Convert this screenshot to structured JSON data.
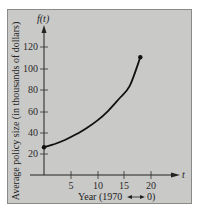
{
  "chart_data": {
    "type": "line",
    "title": "",
    "xlabel": "Year (1970 → 0)",
    "ylabel": "Average policy size (in thousands of dollars)",
    "x_axis_name": "t",
    "y_axis_name": "f(t)",
    "xlim": [
      0,
      22
    ],
    "ylim": [
      0,
      130
    ],
    "x_ticks": [
      5,
      10,
      15,
      20
    ],
    "y_ticks": [
      20,
      40,
      60,
      80,
      100,
      120
    ],
    "grid": false,
    "legend": null,
    "series": [
      {
        "name": "f(t)",
        "x": [
          0,
          2,
          4,
          6,
          8,
          10,
          12,
          14,
          16,
          18
        ],
        "values": [
          26,
          29,
          33,
          38,
          44,
          51,
          60,
          71,
          83,
          110
        ],
        "endpoints_marked": true
      }
    ],
    "annotations": [
      {
        "text": "f(t)",
        "position": "top of y-axis"
      },
      {
        "text": "t",
        "position": "end of x-axis"
      }
    ]
  },
  "labels": {
    "y_axis_name": "f(t)",
    "x_axis_name": "t",
    "ylabel": "Average policy size (in thousands of dollars)",
    "xlabel": "Year (1970 → 0)",
    "xlabel_text": "Year (1970",
    "xlabel_zero": "0)",
    "y_ticks": [
      "120",
      "100",
      "80",
      "60",
      "40",
      "20"
    ],
    "x_ticks": [
      "5",
      "10",
      "15",
      "20"
    ]
  }
}
